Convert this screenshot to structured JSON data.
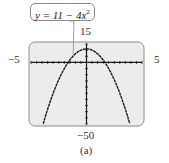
{
  "chart_data": {
    "type": "line",
    "title": "",
    "equation": {
      "lhs": "y",
      "rhs_text": "11 − 4x",
      "exponent": "2"
    },
    "function": {
      "a": -4,
      "b": 0,
      "c": 11
    },
    "xlim": [
      -5,
      5
    ],
    "ylim": [
      -50,
      15
    ],
    "x_tick_step": 0.5,
    "y_tick_step": 5,
    "window_labels": {
      "xmin": "−5",
      "xmax": "5",
      "ymin": "−50",
      "ymax": "15"
    },
    "caption": "(a)",
    "grid": false,
    "colors": {
      "screen_bg": "#ececec",
      "screen_border": "#8c8c8c",
      "curve": "#1a1a1a",
      "axis": "#1a1a1a"
    }
  }
}
